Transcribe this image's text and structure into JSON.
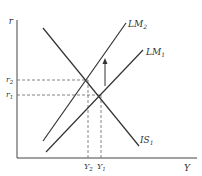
{
  "diagram": {
    "axes": {
      "y_label": "r",
      "x_label": "Y"
    },
    "curves": [
      {
        "id": "IS1",
        "label_main": "IS",
        "label_sub": "1",
        "type": "downward"
      },
      {
        "id": "LM1",
        "label_main": "LM",
        "label_sub": "1",
        "type": "upward"
      },
      {
        "id": "LM2",
        "label_main": "LM",
        "label_sub": "2",
        "type": "upward"
      }
    ],
    "ticks": {
      "r2": {
        "main": "r",
        "sub": "2"
      },
      "r1": {
        "main": "r",
        "sub": "1"
      },
      "Y2": {
        "main": "Y",
        "sub": "2"
      },
      "Y1": {
        "main": "Y",
        "sub": "1"
      }
    },
    "arrow": {
      "direction": "up",
      "meaning": "LM shifts from LM1 to LM2"
    },
    "colors": {
      "line": "#333333",
      "dashed": "#555555",
      "background": "#ffffff"
    }
  }
}
